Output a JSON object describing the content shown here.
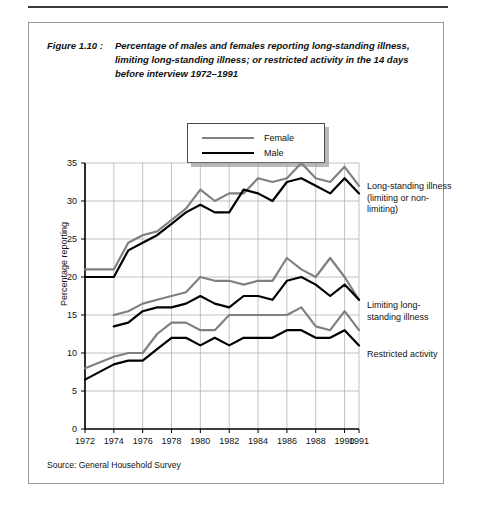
{
  "figure": {
    "number": "Figure 1.10 :",
    "caption": "Percentage of males and females reporting long-standing illness, limiting long-standing illness; or restricted activity in the 14 days before interview 1972–1991",
    "source": "Source: General Household Survey"
  },
  "legend": {
    "items": [
      {
        "label": "Female",
        "color": "#808080"
      },
      {
        "label": "Male",
        "color": "#000000"
      }
    ]
  },
  "annotations": [
    {
      "id": "long-standing-illness",
      "text": "Long-standing illness (limiting or non-limiting)"
    },
    {
      "id": "limiting-long-standing-illness",
      "text": "Limiting long-standing illness"
    },
    {
      "id": "restricted-activity",
      "text": "Restricted activity"
    }
  ],
  "chart_data": {
    "type": "line",
    "title": "Percentage of males and females reporting long-standing illness, limiting long-standing illness; or restricted activity in the 14 days before interview 1972–1991",
    "xlabel": "",
    "ylabel": "Percentage reporting",
    "ylim": [
      0,
      35
    ],
    "yticks": [
      0,
      5,
      10,
      15,
      20,
      25,
      30,
      35
    ],
    "xlim": [
      1972,
      1991
    ],
    "xticks": [
      1972,
      1974,
      1976,
      1978,
      1980,
      1982,
      1984,
      1986,
      1988,
      1990,
      1991
    ],
    "xtick_labels": [
      "1972",
      "1974",
      "1976",
      "1978",
      "1980",
      "1982",
      "1984",
      "1986",
      "1988",
      "1990",
      "1991"
    ],
    "grid": true,
    "legend_position": "top-center",
    "x": [
      1972,
      1974,
      1975,
      1976,
      1977,
      1978,
      1979,
      1980,
      1981,
      1982,
      1983,
      1984,
      1985,
      1986,
      1987,
      1988,
      1989,
      1990,
      1991
    ],
    "groups": [
      {
        "name": "Long-standing illness (limiting or non-limiting)",
        "series": [
          {
            "name": "Female",
            "color": "#808080",
            "values": [
              21.0,
              21.0,
              24.5,
              25.5,
              26.0,
              27.5,
              29.0,
              31.5,
              30.0,
              31.0,
              31.0,
              33.0,
              32.5,
              33.0,
              35.0,
              33.0,
              32.5,
              34.5,
              32.0
            ]
          },
          {
            "name": "Male",
            "color": "#000000",
            "values": [
              20.0,
              20.0,
              23.5,
              24.5,
              25.5,
              27.0,
              28.5,
              29.5,
              28.5,
              28.5,
              31.5,
              31.0,
              30.0,
              32.5,
              33.0,
              32.0,
              31.0,
              33.0,
              31.0
            ]
          }
        ]
      },
      {
        "name": "Limiting long-standing illness",
        "series": [
          {
            "name": "Female",
            "color": "#808080",
            "values": [
              null,
              15.0,
              15.5,
              16.5,
              17.0,
              17.5,
              18.0,
              20.0,
              19.5,
              19.5,
              19.0,
              19.5,
              19.5,
              22.5,
              21.0,
              20.0,
              22.5,
              20.0,
              17.0
            ]
          },
          {
            "name": "Male",
            "color": "#000000",
            "values": [
              null,
              13.5,
              14.0,
              15.5,
              16.0,
              16.0,
              16.5,
              17.5,
              16.5,
              16.0,
              17.5,
              17.5,
              17.0,
              19.5,
              20.0,
              19.0,
              17.5,
              19.0,
              17.0
            ]
          }
        ]
      },
      {
        "name": "Restricted activity",
        "series": [
          {
            "name": "Female",
            "color": "#808080",
            "values": [
              8.0,
              9.5,
              10.0,
              10.0,
              12.5,
              14.0,
              14.0,
              13.0,
              13.0,
              15.0,
              15.0,
              15.0,
              15.0,
              15.0,
              16.0,
              13.5,
              13.0,
              15.5,
              13.0
            ]
          },
          {
            "name": "Male",
            "color": "#000000",
            "values": [
              6.5,
              8.5,
              9.0,
              9.0,
              10.5,
              12.0,
              12.0,
              11.0,
              12.0,
              11.0,
              12.0,
              12.0,
              12.0,
              13.0,
              13.0,
              12.0,
              12.0,
              13.0,
              11.0
            ]
          }
        ]
      }
    ]
  }
}
